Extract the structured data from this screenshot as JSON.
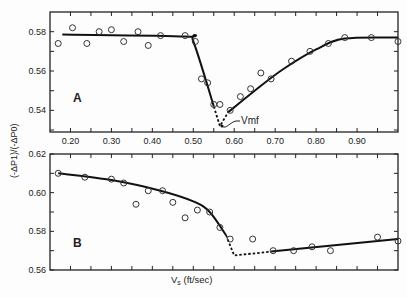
{
  "chart_data": [
    {
      "type": "scatter",
      "panel_label": "A",
      "title": "",
      "xlabel": "Vs (ft/sec)",
      "ylabel": "(-ΔP1)/(-ΔP0)",
      "xlim": [
        0.15,
        1.0
      ],
      "ylim": [
        0.529,
        0.59
      ],
      "x_ticks": [
        "0.20",
        "0.30",
        "0.40",
        "0.50",
        "0.60",
        "0.70",
        "0.80",
        "0.90"
      ],
      "y_ticks": [
        "0.54",
        "0.56",
        "0.58"
      ],
      "annotation": "Vmf",
      "annotation_point": [
        0.565,
        0.531
      ],
      "points": {
        "x": [
          0.17,
          0.205,
          0.24,
          0.27,
          0.3,
          0.33,
          0.365,
          0.39,
          0.42,
          0.48,
          0.505,
          0.52,
          0.535,
          0.55,
          0.565,
          0.59,
          0.615,
          0.64,
          0.665,
          0.69,
          0.74,
          0.785,
          0.83,
          0.87,
          0.935,
          1.0
        ],
        "y": [
          0.574,
          0.582,
          0.574,
          0.58,
          0.581,
          0.575,
          0.58,
          0.573,
          0.578,
          0.578,
          0.575,
          0.556,
          0.554,
          0.543,
          0.543,
          0.54,
          0.547,
          0.551,
          0.559,
          0.556,
          0.565,
          0.57,
          0.574,
          0.577,
          0.577,
          0.575
        ]
      },
      "fit_curve": {
        "solid_left": [
          [
            0.18,
            0.5785
          ],
          [
            0.48,
            0.5775
          ],
          [
            0.5,
            0.575
          ],
          [
            0.55,
            0.542
          ]
        ],
        "dashed": [
          [
            0.55,
            0.542
          ],
          [
            0.565,
            0.532
          ],
          [
            0.585,
            0.539
          ]
        ],
        "solid_right": [
          [
            0.585,
            0.539
          ],
          [
            0.65,
            0.55
          ],
          [
            0.72,
            0.561
          ],
          [
            0.8,
            0.571
          ],
          [
            0.87,
            0.5765
          ],
          [
            1.0,
            0.577
          ]
        ]
      },
      "grid": false
    },
    {
      "type": "scatter",
      "panel_label": "B",
      "title": "",
      "xlabel": "Vs (ft/sec)",
      "ylabel": "(-ΔP1)/(-ΔP0)",
      "xlim": [
        0.15,
        1.0
      ],
      "ylim": [
        0.56,
        0.62
      ],
      "x_ticks": [
        "0.20",
        "0.30",
        "0.40",
        "0.50",
        "0.60",
        "0.70",
        "0.80",
        "0.90"
      ],
      "y_ticks": [
        "0.56",
        "0.58",
        "0.60",
        "0.62"
      ],
      "points": {
        "x": [
          0.17,
          0.235,
          0.3,
          0.33,
          0.36,
          0.39,
          0.425,
          0.45,
          0.48,
          0.51,
          0.54,
          0.565,
          0.59,
          0.645,
          0.695,
          0.745,
          0.79,
          0.835,
          0.95,
          1.0
        ],
        "y": [
          0.61,
          0.608,
          0.607,
          0.605,
          0.594,
          0.601,
          0.601,
          0.595,
          0.587,
          0.591,
          0.59,
          0.582,
          0.576,
          0.576,
          0.57,
          0.57,
          0.572,
          0.57,
          0.577,
          0.575
        ]
      },
      "fit_curve": {
        "solid_left": [
          [
            0.17,
            0.61
          ],
          [
            0.3,
            0.6065
          ],
          [
            0.42,
            0.601
          ],
          [
            0.5,
            0.5955
          ],
          [
            0.54,
            0.59
          ],
          [
            0.58,
            0.578
          ]
        ],
        "dashed": [
          [
            0.58,
            0.578
          ],
          [
            0.6,
            0.5675
          ],
          [
            0.69,
            0.5695
          ]
        ],
        "solid_right": [
          [
            0.69,
            0.5695
          ],
          [
            1.0,
            0.576
          ]
        ]
      },
      "grid": false
    }
  ],
  "labels": {
    "panel_a": "A",
    "panel_b": "B",
    "vmf": "Vmf",
    "xlabel_main": "V",
    "xlabel_sub": "s",
    "xlabel_units": " (ft/sec)",
    "ylabel": "(-ΔP1)/(-ΔP0)"
  }
}
